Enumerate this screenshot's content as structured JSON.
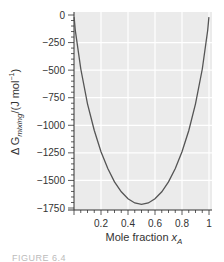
{
  "chart_data": {
    "type": "line",
    "title": "",
    "xlabel": "Mole fraction x_A",
    "ylabel": "ΔG_mixing/(J mol⁻¹)",
    "xlim": [
      0,
      1
    ],
    "ylim": [
      -1750,
      0
    ],
    "x_ticks": [
      0.2,
      0.4,
      0.6,
      0.8,
      1
    ],
    "x_tick_labels": [
      "0.2",
      "0.4",
      "0.6",
      "0.8",
      "1"
    ],
    "y_ticks": [
      0,
      -250,
      -500,
      -750,
      -1000,
      -1250,
      -1500,
      -1750
    ],
    "y_tick_labels": [
      "0",
      "−250",
      "−500",
      "−750",
      "−1000",
      "−1250",
      "−1500",
      "−1750"
    ],
    "grid": true,
    "background": "#ebebeb",
    "gridline_color": "#ffffff",
    "line_color": "#555555",
    "series": [
      {
        "name": "ΔG_mixing",
        "x": [
          0.001,
          0.01,
          0.05,
          0.1,
          0.15,
          0.2,
          0.25,
          0.3,
          0.35,
          0.4,
          0.45,
          0.5,
          0.55,
          0.6,
          0.65,
          0.7,
          0.75,
          0.8,
          0.85,
          0.9,
          0.95,
          0.99,
          0.999
        ],
        "values": [
          -19,
          -139,
          -490,
          -805,
          -1047,
          -1240,
          -1393,
          -1513,
          -1603,
          -1667,
          -1705,
          -1717,
          -1705,
          -1667,
          -1603,
          -1513,
          -1393,
          -1240,
          -1047,
          -805,
          -490,
          -139,
          -19
        ]
      }
    ],
    "legend": null
  },
  "labels": {
    "y_axis_main": "Δ G",
    "y_axis_sub": "mixing",
    "y_axis_unit": "/(J mol",
    "y_axis_sup": "−1",
    "y_axis_close": ")",
    "x_axis_main": "Mole fraction ",
    "x_axis_var": "x",
    "x_axis_sub": "A"
  },
  "caption": "FIGURE 6.4"
}
